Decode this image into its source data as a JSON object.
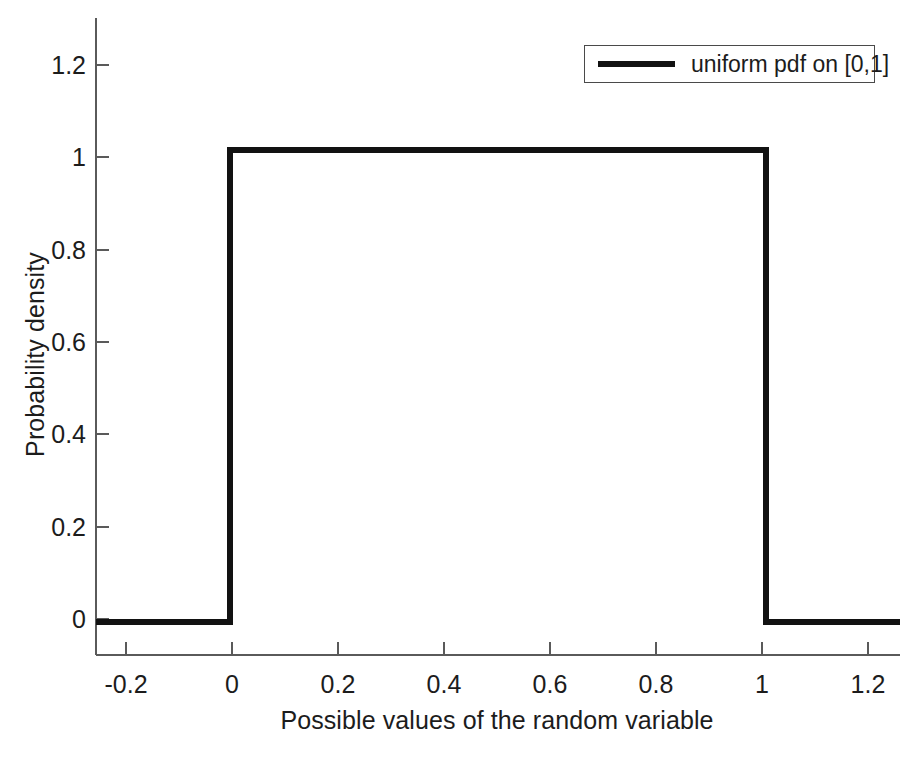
{
  "chart_data": {
    "type": "line",
    "title": "",
    "xlabel": "Possible values of the random variable",
    "ylabel": "Probability density",
    "xlim": [
      -0.25,
      1.25
    ],
    "ylim": [
      -0.07,
      1.28
    ],
    "grid": false,
    "legend_position": "top-right",
    "xticks": [
      "-0.2",
      "0",
      "0.2",
      "0.4",
      "0.6",
      "0.8",
      "1",
      "1.2"
    ],
    "xtick_values": [
      -0.2,
      0,
      0.2,
      0.4,
      0.6,
      0.8,
      1,
      1.2
    ],
    "yticks": [
      "0",
      "0.2",
      "0.4",
      "0.6",
      "0.8",
      "1",
      "1.2"
    ],
    "ytick_values": [
      0,
      0.2,
      0.4,
      0.6,
      0.8,
      1,
      1.2
    ],
    "series": [
      {
        "name": "uniform pdf on [0,1]",
        "color": "#121212",
        "linewidth": 5,
        "x": [
          -0.25,
          0,
          0,
          1,
          1,
          1.25
        ],
        "y": [
          0,
          0,
          1,
          1,
          0,
          0
        ]
      }
    ],
    "legend": [
      {
        "label": "uniform pdf on [0,1]",
        "color": "#121212"
      }
    ]
  },
  "figure": {
    "background": "#ffffff",
    "axis_color": "#5a5a5a",
    "text_color": "#1c1c1c"
  }
}
